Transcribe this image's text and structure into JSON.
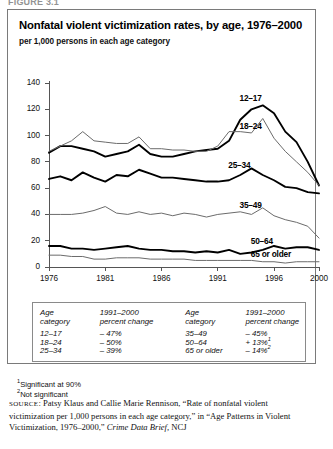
{
  "figure_label": "FIGURE 3.1",
  "title": "Nonfatal violent victimization rates, by age, 1976–2000",
  "subtitle": "per 1,000 persons in each age category",
  "footnotes": [
    {
      "marker": "1",
      "text": "Significant at 90%"
    },
    {
      "marker": "2",
      "text": "Not significant"
    }
  ],
  "source": {
    "prefix": "SOURCE",
    "part1": ": Patsy Klaus and Callie Marie Rennison, “Rate of nonfatal violent victimization per 1,000 persons in each age category,” in “Age Patterns in Violent Victimization, 1976–2000,” ",
    "italic": "Crime Data Brief,",
    "part2": " NCJ"
  },
  "table": {
    "headers_left": [
      "Age",
      "category",
      "1991–2000",
      "percent change"
    ],
    "headers_right": [
      "Age",
      "category",
      "1991–2000",
      "percent change"
    ],
    "rows": [
      {
        "age_left": "12–17",
        "change_left": "– 47%",
        "age_right": "35–49",
        "change_right": "– 45%",
        "sup_right": ""
      },
      {
        "age_left": "18–24",
        "change_left": "– 50%",
        "age_right": "50–64",
        "change_right": "+ 13%",
        "sup_right": "1"
      },
      {
        "age_left": "25–34",
        "change_left": "– 39%",
        "age_right": "65 or older",
        "change_right": "– 14%",
        "sup_right": "2"
      }
    ]
  },
  "chart_data": {
    "type": "line",
    "title": "Nonfatal violent victimization rates, by age, 1976–2000",
    "subtitle": "per 1,000 persons in each age category",
    "xlabel": "",
    "ylabel": "per 1,000 persons in each age category",
    "xlim": [
      1976,
      2000
    ],
    "ylim": [
      0,
      140
    ],
    "yticks": [
      0,
      20,
      40,
      60,
      80,
      100,
      120,
      140
    ],
    "xticks": [
      1976,
      1981,
      1986,
      1991,
      1996,
      2000
    ],
    "grid": false,
    "legend": "inline-labels",
    "x": [
      1976,
      1977,
      1978,
      1979,
      1980,
      1981,
      1982,
      1983,
      1984,
      1985,
      1986,
      1987,
      1988,
      1989,
      1990,
      1991,
      1992,
      1993,
      1994,
      1995,
      1996,
      1997,
      1998,
      1999,
      2000
    ],
    "series": [
      {
        "name": "12–17",
        "label": "12–17",
        "color": "#000000",
        "width": 1.9,
        "values": [
          87,
          92,
          92,
          90,
          88,
          84,
          86,
          88,
          93,
          86,
          84,
          84,
          86,
          88,
          89,
          90,
          96,
          112,
          120,
          123,
          117,
          103,
          95,
          80,
          62
        ]
      },
      {
        "name": "18–24",
        "label": "18–24",
        "color": "#6b6b6b",
        "width": 1.0,
        "values": [
          88,
          92,
          96,
          103,
          96,
          95,
          94,
          94,
          99,
          90,
          90,
          89,
          89,
          88,
          88,
          92,
          103,
          103,
          102,
          113,
          98,
          88,
          80,
          72,
          62
        ]
      },
      {
        "name": "25–34",
        "label": "25–34",
        "color": "#000000",
        "width": 1.9,
        "values": [
          67,
          69,
          66,
          72,
          68,
          65,
          70,
          69,
          74,
          71,
          68,
          68,
          67,
          66,
          65,
          65,
          66,
          70,
          75,
          70,
          66,
          61,
          60,
          57,
          56
        ]
      },
      {
        "name": "35–49",
        "label": "35–49",
        "color": "#6b6b6b",
        "width": 1.0,
        "values": [
          40,
          40,
          40,
          41,
          43,
          46,
          41,
          40,
          42,
          40,
          41,
          39,
          41,
          40,
          38,
          40,
          41,
          42,
          40,
          45,
          39,
          36,
          34,
          31,
          22
        ]
      },
      {
        "name": "50–64",
        "label": "50–64",
        "color": "#000000",
        "width": 1.9,
        "values": [
          16,
          16,
          14,
          14,
          13,
          14,
          15,
          16,
          14,
          13,
          13,
          12,
          12,
          11,
          12,
          11,
          13,
          10,
          11,
          13,
          16,
          14,
          15,
          15,
          13
        ]
      },
      {
        "name": "65 or older",
        "label": "65 or older",
        "color": "#6b6b6b",
        "width": 1.0,
        "values": [
          9,
          9,
          8,
          8,
          6,
          6,
          7,
          7,
          7,
          6,
          6,
          6,
          6,
          5,
          5,
          5,
          5,
          5,
          5,
          4,
          4,
          3,
          4,
          4,
          4
        ]
      }
    ]
  }
}
